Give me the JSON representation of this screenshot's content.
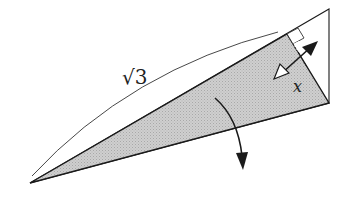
{
  "diagram": {
    "labels": {
      "hypotenuse": "√3",
      "side": "x"
    },
    "colors": {
      "stroke": "#1a1a1a",
      "fill": "#c8c8c8",
      "background": "#ffffff"
    },
    "elements": [
      "outer-triangle",
      "shaded-triangle",
      "length-arc",
      "right-angle-marker",
      "double-arrow",
      "fold-arrow"
    ]
  }
}
